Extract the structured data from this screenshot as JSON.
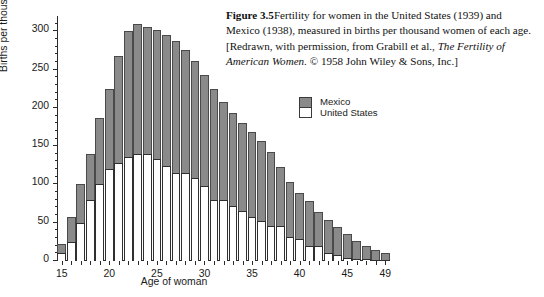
{
  "caption": {
    "figure_label": "Figure 3.5",
    "text_part1": "Fertility for women in the United States (1939) and Mexico (1938), measured in births per thousand women of each age. [Redrawn, with permission, from Grabill et al., ",
    "italic_title": "The Fertility of American Women.",
    "text_part2": " © 1958 John Wiley & Sons, Inc.]"
  },
  "legend": {
    "position": "upper-right",
    "entries": [
      {
        "label": "Mexico",
        "color": "#8a8a8a"
      },
      {
        "label": "United States",
        "color": "#ffffff"
      }
    ]
  },
  "colors": {
    "mexico_fill": "#8a8a8a",
    "united_states_fill": "#ffffff",
    "axis": "#2a2a2a",
    "bar_outline": "#4a4a4a",
    "background": "#ffffff"
  },
  "chart_data": {
    "type": "bar",
    "stacked": true,
    "title": "",
    "subtitle": "",
    "xlabel": "Age of woman",
    "ylabel": "Births per thousand women",
    "xlim": [
      14.5,
      49.5
    ],
    "ylim": [
      0,
      320
    ],
    "yticks": [
      0,
      50,
      100,
      150,
      200,
      250,
      300
    ],
    "ytick_labels": [
      "0",
      "50",
      "100",
      "150",
      "200",
      "250",
      "300"
    ],
    "xticks": [
      15,
      20,
      25,
      30,
      35,
      40,
      45,
      49
    ],
    "xtick_labels": [
      "15",
      "20",
      "25",
      "30",
      "35",
      "40",
      "45",
      "49"
    ],
    "grid": false,
    "legend_position": "upper-right",
    "categories": [
      15,
      16,
      17,
      18,
      19,
      20,
      21,
      22,
      23,
      24,
      25,
      26,
      27,
      28,
      29,
      30,
      31,
      32,
      33,
      34,
      35,
      36,
      37,
      38,
      39,
      40,
      41,
      42,
      43,
      44,
      45,
      46,
      47,
      48,
      49
    ],
    "series": [
      {
        "name": "United States",
        "note": "white segment, bottom of each stacked bar",
        "values": [
          10,
          25,
          50,
          80,
          100,
          120,
          128,
          136,
          140,
          140,
          133,
          124,
          115,
          115,
          108,
          98,
          80,
          80,
          72,
          65,
          58,
          52,
          46,
          46,
          31,
          29,
          19,
          19,
          11,
          8,
          4,
          3,
          2,
          1,
          1
        ]
      },
      {
        "name": "Mexico",
        "note": "gray segment, plotted above the U.S. segment; values are the Mexico totals, not the increment",
        "values": [
          22,
          58,
          100,
          140,
          187,
          225,
          268,
          300,
          309,
          305,
          302,
          295,
          287,
          275,
          261,
          243,
          225,
          208,
          193,
          180,
          169,
          157,
          142,
          123,
          103,
          89,
          78,
          64,
          53,
          44,
          35,
          26,
          19,
          14,
          10
        ]
      }
    ]
  }
}
